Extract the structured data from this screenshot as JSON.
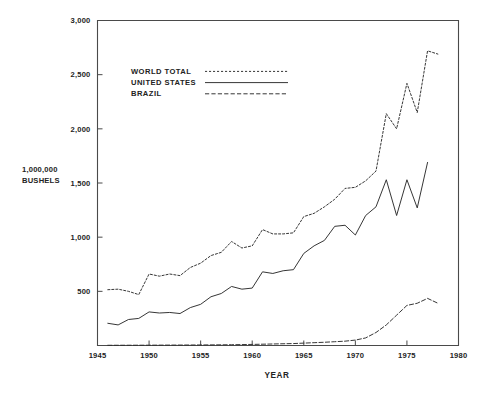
{
  "chart_data": {
    "type": "line",
    "title": "",
    "xlabel": "YEAR",
    "ylabel": "1,000,000 BUSHELS",
    "ylabel_line1": "1,000,000",
    "ylabel_line2": "BUSHELS",
    "xlim": [
      1945,
      1980
    ],
    "ylim": [
      0,
      3000
    ],
    "xticks": [
      1945,
      1950,
      1955,
      1960,
      1965,
      1970,
      1975,
      1980
    ],
    "xtick_labels": [
      "1945",
      "1950",
      "1955",
      "1960",
      "1965",
      "1970",
      "1975",
      "1980"
    ],
    "yticks": [
      500,
      1000,
      1500,
      2000,
      2500,
      3000
    ],
    "ytick_labels": [
      "500",
      "1,000",
      "1,500",
      "2,000",
      "2,500",
      "3,000"
    ],
    "grid": false,
    "legend_position": "upper-left-inside",
    "line_color": "#2b2b2b",
    "axis_color": "#4a4a4a",
    "background": "#ffffff",
    "series": [
      {
        "name": "WORLD TOTAL",
        "style": "dotted",
        "x": [
          1946,
          1947,
          1948,
          1949,
          1950,
          1951,
          1952,
          1953,
          1954,
          1955,
          1956,
          1957,
          1958,
          1959,
          1960,
          1961,
          1962,
          1963,
          1964,
          1965,
          1966,
          1967,
          1968,
          1969,
          1970,
          1971,
          1972,
          1973,
          1974,
          1975,
          1976,
          1977,
          1978
        ],
        "values": [
          515,
          520,
          500,
          470,
          660,
          640,
          660,
          645,
          720,
          760,
          830,
          860,
          960,
          900,
          920,
          1070,
          1030,
          1030,
          1040,
          1190,
          1220,
          1280,
          1350,
          1450,
          1460,
          1520,
          1610,
          2140,
          2000,
          2420,
          2150,
          2720,
          2690
        ]
      },
      {
        "name": "UNITED STATES",
        "style": "solid",
        "x": [
          1946,
          1947,
          1948,
          1949,
          1950,
          1951,
          1952,
          1953,
          1954,
          1955,
          1956,
          1957,
          1958,
          1959,
          1960,
          1961,
          1962,
          1963,
          1964,
          1965,
          1966,
          1967,
          1968,
          1969,
          1970,
          1971,
          1972,
          1973,
          1974,
          1975,
          1976,
          1977
        ],
        "values": [
          205,
          190,
          240,
          250,
          310,
          300,
          305,
          295,
          350,
          380,
          450,
          480,
          545,
          520,
          530,
          680,
          665,
          690,
          700,
          850,
          920,
          970,
          1100,
          1110,
          1020,
          1200,
          1280,
          1530,
          1200,
          1530,
          1270,
          1690
        ]
      },
      {
        "name": "BRAZIL",
        "style": "dashed",
        "x": [
          1946,
          1950,
          1955,
          1958,
          1960,
          1962,
          1964,
          1965,
          1966,
          1967,
          1968,
          1969,
          1970,
          1971,
          1972,
          1973,
          1974,
          1975,
          1976,
          1977,
          1978
        ],
        "values": [
          2,
          3,
          5,
          7,
          10,
          14,
          18,
          22,
          26,
          30,
          35,
          40,
          50,
          70,
          120,
          190,
          280,
          370,
          390,
          435,
          390
        ]
      }
    ]
  },
  "legend": {
    "items": [
      {
        "label": "WORLD TOTAL",
        "style": "dotted"
      },
      {
        "label": "UNITED STATES",
        "style": "solid"
      },
      {
        "label": "BRAZIL",
        "style": "dashed"
      }
    ]
  }
}
